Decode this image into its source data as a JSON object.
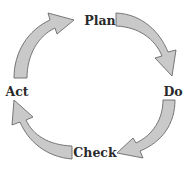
{
  "diagram": {
    "type": "cycle",
    "steps": [
      {
        "id": "plan",
        "label": "Plan"
      },
      {
        "id": "do",
        "label": "Do"
      },
      {
        "id": "check",
        "label": "Check"
      },
      {
        "id": "act",
        "label": "Act"
      }
    ],
    "arrows": [
      {
        "from": "act",
        "to": "plan"
      },
      {
        "from": "plan",
        "to": "do"
      },
      {
        "from": "do",
        "to": "check"
      },
      {
        "from": "check",
        "to": "act"
      }
    ],
    "colors": {
      "arrow_fill": "#c9c9c9",
      "arrow_stroke": "#6a6a6a",
      "text": "#2a2a2a"
    }
  }
}
